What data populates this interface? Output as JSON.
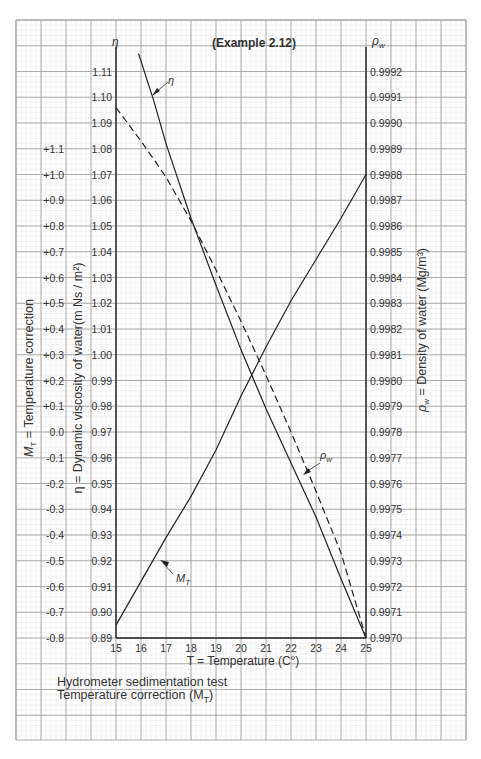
{
  "title": "(Example 2.12)",
  "caption": {
    "line1": "Hydrometer sedimentation test",
    "line2": "Temperature correction (M",
    "line2_sub": "T",
    "line2_end": ")"
  },
  "figure_label": "Chart 2.1",
  "chart_data": {
    "type": "line",
    "title": "(Example 2.12)",
    "xlabel": "T = Temperature (C°)",
    "x_ticks": [
      15,
      16,
      17,
      18,
      19,
      20,
      21,
      22,
      23,
      24,
      25
    ],
    "xlim": [
      15,
      25
    ],
    "axes": {
      "left_outer": {
        "label": "M_T = Temperature correction",
        "ticks": [
          "+1.1",
          "+1.0",
          "+0.9",
          "+0.8",
          "+0.7",
          "+0.6",
          "+0.5",
          "+0.4",
          "+0.3",
          "+0.2",
          "+0.1",
          "0.0",
          "-0.1",
          "-0.2",
          "-0.3",
          "-0.4",
          "-0.5",
          "-0.6",
          "-0.7",
          "-0.8"
        ],
        "range": [
          -0.8,
          1.1
        ]
      },
      "left_inner": {
        "symbol": "η",
        "label": "η = Dynamic viscosity of water(m Ns/m²)",
        "ticks": [
          "1.11",
          "1.10",
          "1.09",
          "1.08",
          "1.07",
          "1.06",
          "1.05",
          "1.04",
          "1.03",
          "1.02",
          "1.01",
          "1.00",
          "0.99",
          "0.98",
          "0.97",
          "0.96",
          "0.95",
          "0.94",
          "0.93",
          "0.92",
          "0.91",
          "0.90",
          "0.89"
        ],
        "range": [
          0.89,
          1.11
        ]
      },
      "right": {
        "symbol": "ρw",
        "label": "ρw = Density of water (Mg/m³)",
        "ticks": [
          "0.9992",
          "0.9991",
          "0.9990",
          "0.9989",
          "0.9988",
          "0.9987",
          "0.9986",
          "0.9985",
          "0.9984",
          "0.9983",
          "0.9982",
          "0.9981",
          "0.9980",
          "0.9979",
          "0.9978",
          "0.9977",
          "0.9976",
          "0.9975",
          "0.9974",
          "0.9973",
          "0.9972",
          "0.9971",
          "0.9970"
        ],
        "range": [
          0.997,
          0.9992
        ]
      }
    },
    "series": [
      {
        "name": "η",
        "style": "solid",
        "axis": "left_inner",
        "x": [
          15.9,
          16.5,
          17,
          18,
          19,
          20,
          21,
          22,
          23,
          24,
          25
        ],
        "y": [
          1.117,
          1.099,
          1.082,
          1.053,
          1.027,
          1.002,
          0.979,
          0.958,
          0.937,
          0.913,
          0.89
        ]
      },
      {
        "name": "ρw",
        "style": "dashed",
        "axis": "right",
        "x": [
          15,
          16,
          17,
          18,
          19,
          20,
          21,
          22,
          23,
          24,
          25
        ],
        "y": [
          0.99906,
          0.99893,
          0.99879,
          0.99862,
          0.99843,
          0.99823,
          0.99802,
          0.9978,
          0.99757,
          0.99733,
          0.997
        ]
      },
      {
        "name": "M_T",
        "style": "solid",
        "axis": "left_outer",
        "x": [
          15,
          16,
          17,
          18,
          19,
          20,
          21,
          22,
          23,
          24,
          25
        ],
        "y": [
          -0.75,
          -0.58,
          -0.41,
          -0.25,
          -0.07,
          0.14,
          0.33,
          0.51,
          0.67,
          0.83,
          1.0
        ]
      }
    ],
    "annotations": [
      "η",
      "ρw",
      "M_T"
    ],
    "grid": true
  },
  "labels": {
    "eta_sym": "η",
    "rho_sym": "ρ",
    "rho_sub": "w",
    "mt_sym": "M",
    "mt_sub": "T",
    "left_outer_axis_label": "M",
    "left_outer_axis_label_sub": "T",
    "left_outer_axis_label_rest": " = Temperature correction",
    "left_inner_axis_label": "η = Dynamic viscosity of water(m Ns / m²)",
    "right_axis_label_sym": "ρ",
    "right_axis_label_sub": "w",
    "right_axis_label_rest": " = Density of water (Mg/m³)"
  }
}
